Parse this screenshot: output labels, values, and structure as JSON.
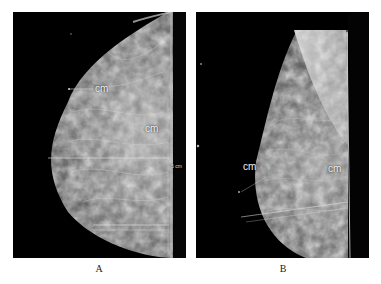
{
  "figure": {
    "panels": [
      {
        "id": "A",
        "caption": "A",
        "annotations": [
          {
            "text": "cm"
          },
          {
            "text": "cm"
          },
          {
            "text": "5 cm"
          }
        ]
      },
      {
        "id": "B",
        "caption": "B",
        "annotations": [
          {
            "text": "cm"
          },
          {
            "text": "cm"
          }
        ]
      }
    ]
  },
  "colors": {
    "background": "#ffffff",
    "panel_background": "#000000",
    "annotation_text": "#f2f2f2",
    "caption_text": "#222222"
  }
}
